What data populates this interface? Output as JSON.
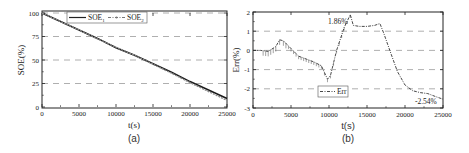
{
  "chart_data": [
    {
      "type": "line",
      "panel_label": "(a)",
      "title": "",
      "xlabel": "t(s)",
      "ylabel": "SOE(%)",
      "xlim": [
        0,
        25000
      ],
      "ylim": [
        0,
        100
      ],
      "xticks": [
        "0",
        "5000",
        "10000",
        "15000",
        "20000",
        "25000"
      ],
      "yticks": [
        "0",
        "25",
        "50",
        "75",
        "100"
      ],
      "grid": "horizontal dashed at 25, 50, 75, 100",
      "legend": {
        "position": "top-center",
        "entries": [
          "SOE1",
          "SOE2"
        ]
      },
      "legend_labels": {
        "soe1_base": "SOE",
        "soe1_sub": "1",
        "soe2_base": "SOE",
        "soe2_sub": "2"
      },
      "x": [
        0,
        2500,
        5000,
        7500,
        10000,
        12500,
        15000,
        17500,
        20000,
        22500,
        25000
      ],
      "series": [
        {
          "name": "SOE1",
          "style": "solid",
          "values": [
            100,
            91,
            82,
            73,
            63,
            55,
            46,
            37,
            27,
            18,
            9
          ]
        },
        {
          "name": "SOE2",
          "style": "dash-dot with markers",
          "values": [
            100,
            91,
            82,
            72.5,
            63.5,
            55,
            45.5,
            36,
            26,
            16.5,
            7
          ]
        }
      ]
    },
    {
      "type": "line",
      "panel_label": "(b)",
      "title": "",
      "xlabel": "t(s)",
      "ylabel": "Err(%)",
      "xlim": [
        0,
        25000
      ],
      "ylim": [
        -3,
        2
      ],
      "xticks": [
        "0",
        "5000",
        "10000",
        "15000",
        "20000",
        "25000"
      ],
      "yticks": [
        "-3",
        "-2",
        "-1",
        "0",
        "1",
        "2"
      ],
      "grid": "horizontal dashed at -2, -1, 0, 1",
      "legend": {
        "position": "lower-left-center",
        "entries": [
          "Err"
        ]
      },
      "annotations": [
        {
          "text": "1.86%",
          "x": 12800,
          "y": 1.86
        },
        {
          "text": "-2.54%",
          "x": 24500,
          "y": -2.54
        }
      ],
      "x": [
        0,
        1000,
        2000,
        3000,
        3500,
        4000,
        5000,
        6000,
        7000,
        8000,
        9000,
        9800,
        10200,
        11000,
        12000,
        12800,
        13200,
        14000,
        15000,
        16000,
        16700,
        17200,
        18000,
        19000,
        20000,
        21000,
        22000,
        23000,
        24000,
        25000
      ],
      "series": [
        {
          "name": "Err",
          "style": "dash-dot",
          "values": [
            0.0,
            0.0,
            -0.05,
            0.2,
            0.55,
            0.5,
            0.1,
            -0.3,
            -0.45,
            -0.6,
            -0.8,
            -1.5,
            -1.3,
            0.0,
            1.2,
            1.86,
            1.3,
            1.25,
            1.25,
            1.3,
            1.4,
            0.9,
            0.0,
            -1.1,
            -1.8,
            -2.1,
            -2.2,
            -2.25,
            -2.4,
            -2.54
          ]
        }
      ]
    }
  ]
}
